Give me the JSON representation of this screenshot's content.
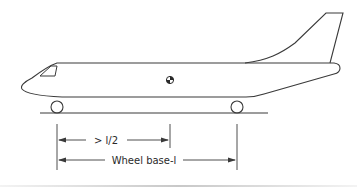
{
  "diagram": {
    "colors": {
      "line": "#3a3a3a",
      "background": "#ffffff",
      "rule": "#c8c8c8"
    },
    "parts": [
      "fuselage",
      "cockpit-window",
      "tail-fin",
      "center-of-gravity-symbol",
      "front-wheel",
      "rear-wheel",
      "ground-line"
    ],
    "dimensions": [
      {
        "id": "half",
        "label": "> l/2",
        "from": "front-wheel",
        "to": "center-of-gravity"
      },
      {
        "id": "wheelbase",
        "label": "Wheel base-l",
        "from": "front-wheel",
        "to": "rear-wheel"
      }
    ]
  },
  "labels": {
    "half": "> l/2",
    "wheelbase": "Wheel base-l"
  }
}
